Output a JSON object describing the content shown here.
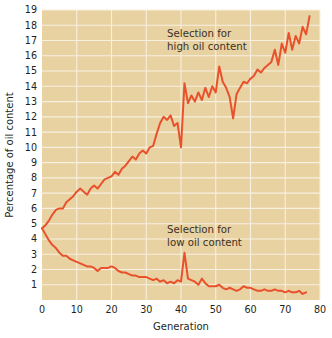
{
  "chart_data": {
    "type": "line",
    "title": "",
    "xlabel": "Generation",
    "ylabel": "Percentage of oil content",
    "xlim": [
      0,
      80
    ],
    "ylim": [
      0,
      19
    ],
    "xticks": [
      0,
      10,
      20,
      30,
      40,
      50,
      60,
      70,
      80
    ],
    "yticks": [
      1,
      2,
      3,
      4,
      5,
      6,
      7,
      8,
      9,
      10,
      11,
      12,
      13,
      14,
      15,
      16,
      17,
      18,
      19
    ],
    "grid": true,
    "legend_position": "inline-annotations",
    "plot_background_color": "#e8d2a2",
    "gridline_color": "#f7efe0",
    "series_color": "#e8512b",
    "annotations": [
      {
        "name": "high-oil-annotation",
        "lines": [
          "Selection for",
          "high oil content"
        ],
        "x": 36,
        "y": 17.2
      },
      {
        "name": "low-oil-annotation",
        "lines": [
          "Selection for",
          "low oil content"
        ],
        "x": 36,
        "y": 4.4
      }
    ],
    "series": [
      {
        "name": "Selection for high oil content",
        "color": "#e8512b",
        "x": [
          0,
          1,
          2,
          3,
          4,
          5,
          6,
          7,
          8,
          9,
          10,
          11,
          12,
          13,
          14,
          15,
          16,
          17,
          18,
          19,
          20,
          21,
          22,
          23,
          24,
          25,
          26,
          27,
          28,
          29,
          30,
          31,
          32,
          33,
          34,
          35,
          36,
          37,
          38,
          39,
          40,
          41,
          42,
          43,
          44,
          45,
          46,
          47,
          48,
          49,
          50,
          51,
          52,
          53,
          54,
          55,
          56,
          57,
          58,
          59,
          60,
          61,
          62,
          63,
          64,
          65,
          66,
          67,
          68,
          69,
          70,
          71,
          72,
          73,
          74,
          75,
          76,
          77
        ],
        "values": [
          4.7,
          4.9,
          5.2,
          5.6,
          5.9,
          6.0,
          6.0,
          6.4,
          6.6,
          6.8,
          7.1,
          7.3,
          7.1,
          6.9,
          7.3,
          7.5,
          7.3,
          7.6,
          7.9,
          8.0,
          8.1,
          8.4,
          8.2,
          8.6,
          8.8,
          9.1,
          9.4,
          9.2,
          9.6,
          9.8,
          9.6,
          10.0,
          10.1,
          10.9,
          11.6,
          12.0,
          11.8,
          12.1,
          11.4,
          11.6,
          10.0,
          14.2,
          12.9,
          13.4,
          13.0,
          13.6,
          13.1,
          13.9,
          13.3,
          14.0,
          13.6,
          15.3,
          14.3,
          13.9,
          13.3,
          11.9,
          13.5,
          13.9,
          14.3,
          14.2,
          14.5,
          14.7,
          15.1,
          14.9,
          15.2,
          15.4,
          15.6,
          16.4,
          15.4,
          16.8,
          16.2,
          17.5,
          16.4,
          17.3,
          16.8,
          17.9,
          17.4,
          18.6
        ]
      },
      {
        "name": "Selection for low oil content",
        "color": "#e8512b",
        "x": [
          0,
          1,
          2,
          3,
          4,
          5,
          6,
          7,
          8,
          9,
          10,
          11,
          12,
          13,
          14,
          15,
          16,
          17,
          18,
          19,
          20,
          21,
          22,
          23,
          24,
          25,
          26,
          27,
          28,
          29,
          30,
          31,
          32,
          33,
          34,
          35,
          36,
          37,
          38,
          39,
          40,
          41,
          42,
          43,
          44,
          45,
          46,
          47,
          48,
          49,
          50,
          51,
          52,
          53,
          54,
          55,
          56,
          57,
          58,
          59,
          60,
          61,
          62,
          63,
          64,
          65,
          66,
          67,
          68,
          69,
          70,
          71,
          72,
          73,
          74,
          75,
          76
        ],
        "values": [
          4.7,
          4.3,
          3.9,
          3.6,
          3.4,
          3.1,
          2.9,
          2.9,
          2.7,
          2.6,
          2.5,
          2.4,
          2.3,
          2.2,
          2.2,
          2.1,
          1.9,
          2.1,
          2.1,
          2.1,
          2.2,
          2.1,
          1.9,
          1.8,
          1.8,
          1.7,
          1.6,
          1.6,
          1.5,
          1.5,
          1.5,
          1.4,
          1.3,
          1.4,
          1.2,
          1.3,
          1.1,
          1.2,
          1.1,
          1.3,
          1.2,
          3.1,
          1.4,
          1.3,
          1.2,
          1.0,
          1.4,
          1.1,
          0.9,
          0.9,
          0.9,
          1.0,
          0.8,
          0.7,
          0.8,
          0.7,
          0.6,
          0.7,
          0.9,
          0.8,
          0.8,
          0.7,
          0.6,
          0.6,
          0.7,
          0.6,
          0.6,
          0.7,
          0.6,
          0.6,
          0.5,
          0.6,
          0.5,
          0.5,
          0.6,
          0.4,
          0.5
        ]
      }
    ]
  }
}
